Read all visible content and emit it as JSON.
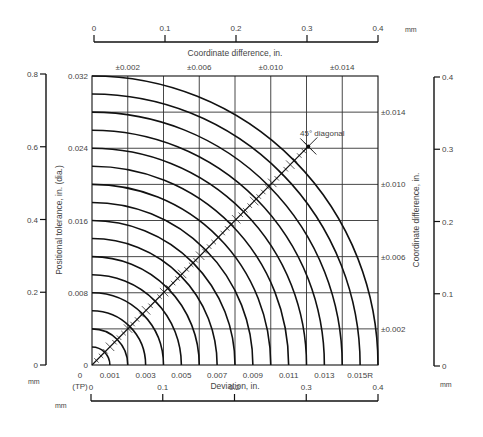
{
  "chart_data": {
    "type": "line",
    "title": "",
    "xlabel": "Deviation, in.",
    "ylabel": "Positional tolerance, in. (dia.)",
    "top_label": "Coordinate difference, in.",
    "right_label": "Coordinate difference, in.",
    "origin_label": "(TP)",
    "diagonal_label": "45° diagonal",
    "xlim": [
      0,
      0.016
    ],
    "ylim_dia": [
      0,
      0.032
    ],
    "grid": true,
    "grid_step_in": 0.002,
    "arc_radii_in": [
      0.001,
      0.002,
      0.003,
      0.004,
      0.005,
      0.006,
      0.007,
      0.008,
      0.009,
      0.01,
      0.011,
      0.012,
      0.013,
      0.014,
      0.015,
      0.016
    ],
    "bottom_ticks": [
      {
        "value": 0,
        "label": "0"
      },
      {
        "value": 0.001,
        "label": "0.001"
      },
      {
        "value": 0.003,
        "label": "0.003"
      },
      {
        "value": 0.005,
        "label": "0.005"
      },
      {
        "value": 0.007,
        "label": "0.007"
      },
      {
        "value": 0.009,
        "label": "0.009"
      },
      {
        "value": 0.011,
        "label": "0.011"
      },
      {
        "value": 0.013,
        "label": "0.013"
      },
      {
        "value": 0.015,
        "label": "0.015R"
      }
    ],
    "left_ticks": [
      {
        "value": 0,
        "label": "0"
      },
      {
        "value": 0.008,
        "label": "0.008"
      },
      {
        "value": 0.016,
        "label": "0.016"
      },
      {
        "value": 0.024,
        "label": "0.024"
      },
      {
        "value": 0.032,
        "label": "0.032"
      }
    ],
    "top_ticks": [
      {
        "value": 0.002,
        "label": "±0.002"
      },
      {
        "value": 0.006,
        "label": "±0.006"
      },
      {
        "value": 0.01,
        "label": "±0.010"
      },
      {
        "value": 0.014,
        "label": "±0.014"
      }
    ],
    "right_ticks": [
      {
        "value": 0.002,
        "label": "±0.002"
      },
      {
        "value": 0.006,
        "label": "±0.006"
      },
      {
        "value": 0.01,
        "label": "±0.010"
      },
      {
        "value": 0.014,
        "label": "±0.014"
      }
    ],
    "diagonal_end_in": 0.0121,
    "mm_scales": {
      "unit": "mm",
      "top": {
        "range": [
          0,
          0.4
        ],
        "ticks": [
          "0",
          "0.1",
          "0.2",
          "0.3",
          "0.4"
        ]
      },
      "bottom": {
        "range": [
          0,
          0.4
        ],
        "ticks": [
          "0",
          "0.1",
          "0.2",
          "0.3",
          "0.4"
        ]
      },
      "left": {
        "range": [
          0,
          0.8
        ],
        "ticks": [
          "0",
          "0.2",
          "0.4",
          "0.6",
          "0.8"
        ]
      },
      "right": {
        "range": [
          0,
          0.4
        ],
        "ticks": [
          "0",
          "0.1",
          "0.2",
          "0.3",
          "0.4"
        ]
      }
    }
  },
  "colors": {
    "ink": "#111111",
    "grid": "#333333",
    "text": "#444444",
    "background": "#ffffff"
  }
}
